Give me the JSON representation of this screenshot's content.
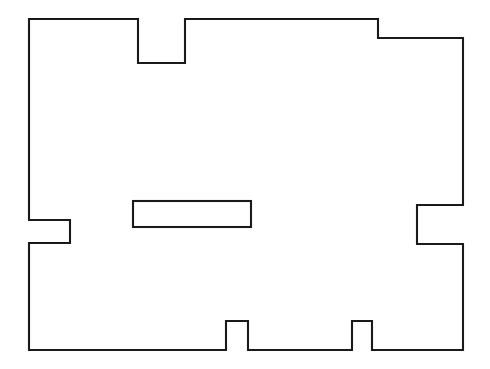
{
  "document": {
    "title": "Floor Plan Outline",
    "canvas": {
      "width": 490,
      "height": 369,
      "background_color": "#ffffff"
    }
  },
  "drawing": {
    "name": "floor-plan-outline",
    "description": "Black line drawing of a rectangular building footprint with rectangular notches on the top, left, right and bottom edges, plus one free-standing interior rectangle.",
    "stroke_color": "#1a1a1a",
    "stroke_width": 2.1,
    "fill": "none",
    "shapes": [
      {
        "name": "outer-wall-outline",
        "type": "polygon",
        "closed": true,
        "points": [
          [
            29,
            19
          ],
          [
            138,
            19
          ],
          [
            138,
            63
          ],
          [
            185,
            63
          ],
          [
            185,
            19
          ],
          [
            378,
            19
          ],
          [
            378,
            38
          ],
          [
            463,
            38
          ],
          [
            463,
            205
          ],
          [
            417,
            205
          ],
          [
            417,
            244
          ],
          [
            463,
            244
          ],
          [
            463,
            350
          ],
          [
            372,
            350
          ],
          [
            372,
            321
          ],
          [
            352,
            321
          ],
          [
            352,
            350
          ],
          [
            248,
            350
          ],
          [
            248,
            321
          ],
          [
            226,
            321
          ],
          [
            226,
            350
          ],
          [
            29,
            350
          ],
          [
            29,
            243
          ],
          [
            70,
            243
          ],
          [
            70,
            220
          ],
          [
            29,
            220
          ]
        ]
      },
      {
        "name": "interior-rectangle",
        "type": "rect",
        "x": 133,
        "y": 201,
        "width": 118,
        "height": 26
      }
    ],
    "features": [
      {
        "name": "top-edge-notch",
        "edge": "top",
        "x_from": 138,
        "x_to": 185,
        "depth": 44
      },
      {
        "name": "top-right-step",
        "edge": "top",
        "x_at": 378,
        "drop": 19
      },
      {
        "name": "left-edge-notch",
        "edge": "left",
        "y_from": 220,
        "y_to": 243,
        "depth": 41
      },
      {
        "name": "right-edge-notch",
        "edge": "right",
        "y_from": 205,
        "y_to": 244,
        "depth": 46
      },
      {
        "name": "bottom-notch-left",
        "edge": "bottom",
        "x_from": 226,
        "x_to": 248,
        "height": 29
      },
      {
        "name": "bottom-notch-right",
        "edge": "bottom",
        "x_from": 352,
        "x_to": 372,
        "height": 29
      }
    ]
  }
}
